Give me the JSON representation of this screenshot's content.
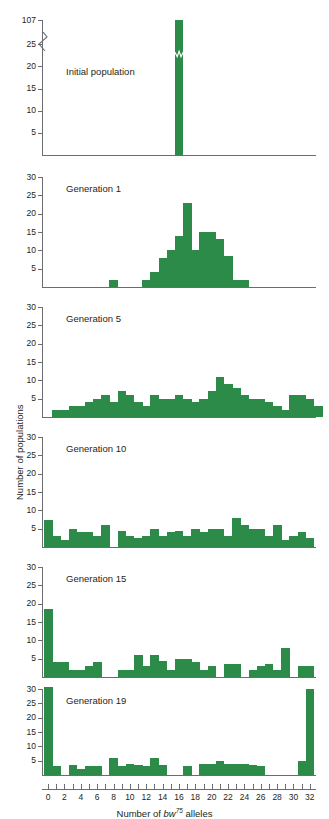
{
  "figure": {
    "y_axis_label": "Number of populations",
    "x_axis_label_parts": {
      "prefix": "Number of ",
      "gene": "bw",
      "sup": "75",
      "suffix": " alleles"
    },
    "bar_color": "#2d8b4a",
    "axis_color": "#6b6b72"
  },
  "chart_data": {
    "type": "bar",
    "title": "",
    "xlabel": "Number of bw75 alleles",
    "ylabel": "Number of populations",
    "xlim": [
      -0.5,
      32.5
    ],
    "grid": false,
    "legend": "none",
    "categories": [
      0,
      1,
      2,
      3,
      4,
      5,
      6,
      7,
      8,
      9,
      10,
      11,
      12,
      13,
      14,
      15,
      16,
      17,
      18,
      19,
      20,
      21,
      22,
      23,
      24,
      25,
      26,
      27,
      28,
      29,
      30,
      31,
      32
    ],
    "x_tick_labels": [
      "0",
      "2",
      "4",
      "6",
      "8",
      "10",
      "12",
      "14",
      "16",
      "18",
      "20",
      "22",
      "24",
      "26",
      "28",
      "30",
      "32"
    ],
    "panels": [
      {
        "label": "Initial population",
        "ylim": [
          0,
          30
        ],
        "y_tick_labels": [
          "5",
          "10",
          "15",
          "20",
          "25",
          "107"
        ],
        "y_ticks": [
          5,
          10,
          15,
          20,
          25
        ],
        "broken_axis": true,
        "broken_axis_top_label": "107",
        "values": [
          0,
          0,
          0,
          0,
          0,
          0,
          0,
          0,
          0,
          0,
          0,
          0,
          0,
          0,
          0,
          0,
          107,
          0,
          0,
          0,
          0,
          0,
          0,
          0,
          0,
          0,
          0,
          0,
          0,
          0,
          0,
          0,
          0
        ]
      },
      {
        "label": "Generation 1",
        "ylim": [
          0,
          30
        ],
        "y_tick_labels": [
          "5",
          "10",
          "15",
          "20",
          "25",
          "30"
        ],
        "y_ticks": [
          5,
          10,
          15,
          20,
          25,
          30
        ],
        "broken_axis": false,
        "values": [
          0,
          0,
          0,
          0,
          0,
          0,
          0,
          0,
          2,
          0,
          0,
          0,
          2,
          4,
          8,
          10,
          14,
          23,
          10,
          15,
          15,
          13,
          8.5,
          2,
          2,
          0,
          0,
          0,
          0,
          0,
          0,
          0,
          0
        ]
      },
      {
        "label": "Generation 5",
        "ylim": [
          0,
          30
        ],
        "y_tick_labels": [
          "5",
          "10",
          "15",
          "20",
          "25",
          "30"
        ],
        "y_ticks": [
          5,
          10,
          15,
          20,
          25,
          30
        ],
        "broken_axis": false,
        "values": [
          0,
          2,
          2,
          3,
          3,
          4,
          5,
          6,
          4,
          7,
          6,
          4,
          3,
          6,
          5,
          5,
          6,
          5,
          4,
          5,
          7,
          11,
          9,
          8,
          6,
          5,
          5,
          4,
          3,
          2,
          6,
          6,
          5,
          3
        ]
      },
      {
        "label": "Generation 10",
        "ylim": [
          0,
          30
        ],
        "y_tick_labels": [
          "5",
          "10",
          "15",
          "20",
          "25",
          "30"
        ],
        "y_ticks": [
          5,
          10,
          15,
          20,
          25,
          30
        ],
        "broken_axis": false,
        "values": [
          7.5,
          3,
          2,
          5,
          4,
          4,
          3,
          6,
          0,
          4.5,
          3,
          2.5,
          3,
          5,
          3,
          4,
          4.5,
          3,
          5,
          4,
          5,
          5,
          3,
          8,
          6,
          5,
          5,
          3,
          6,
          2,
          3,
          4,
          2.5
        ]
      },
      {
        "label": "Generation 15",
        "ylim": [
          0,
          30
        ],
        "y_tick_labels": [
          "5",
          "10",
          "15",
          "20",
          "25",
          "30"
        ],
        "y_ticks": [
          5,
          10,
          15,
          20,
          25,
          30
        ],
        "broken_axis": false,
        "values": [
          18.5,
          4,
          4,
          2,
          2,
          3,
          4,
          0,
          0,
          2,
          2,
          6,
          3,
          6,
          4.5,
          2,
          5,
          5,
          4,
          2,
          3,
          0,
          3.5,
          3.5,
          0,
          2,
          3,
          3.5,
          2,
          8,
          0,
          3,
          3
        ]
      },
      {
        "label": "Generation 19",
        "ylim": [
          0,
          30
        ],
        "y_tick_labels": [
          "5",
          "10",
          "15",
          "20",
          "25",
          "30"
        ],
        "y_ticks": [
          5,
          10,
          15,
          20,
          25,
          30
        ],
        "broken_axis": false,
        "values": [
          31,
          3,
          0,
          3.5,
          2,
          3,
          3,
          0,
          6,
          3,
          4,
          3.5,
          3,
          6,
          3.5,
          0,
          0,
          3,
          0,
          4,
          4,
          5,
          4,
          4,
          4,
          3.5,
          3,
          0,
          0,
          0,
          0,
          5,
          30
        ]
      }
    ]
  }
}
